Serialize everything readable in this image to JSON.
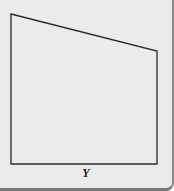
{
  "diagram": {
    "shape": "quadrilateral",
    "vertices": [
      [
        11,
        14
      ],
      [
        157,
        51
      ],
      [
        157,
        164
      ],
      [
        11,
        164
      ]
    ],
    "stroke_color": "#2a2a2a",
    "background_color": "#ebebeb",
    "bottom_label": "Y"
  }
}
